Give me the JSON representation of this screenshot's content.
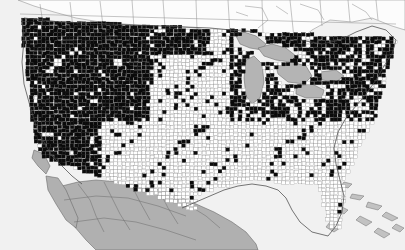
{
  "figure": {
    "name": "us-county-choropleth",
    "title": "",
    "subtitle": "",
    "caption": "",
    "has_title": false,
    "has_legend": false,
    "has_axes": false,
    "width": 405,
    "height": 250
  },
  "colors": {
    "filled_county": "#0b0b0b",
    "empty_county": "#ffffff",
    "county_border": "#8a8a8a",
    "coastline": "#4a4a4a",
    "foreign_land": "#b0b0b0",
    "lakes": "#b4b4b4",
    "canada": "#fcfcfc",
    "ocean": "#f1f1f1"
  },
  "chart_data": {
    "type": "map",
    "title": "",
    "xlabel": "",
    "ylabel": "",
    "projection": "albers-usa-like",
    "geography": "us-counties",
    "legend_position": "none",
    "classes": [
      {
        "key": "filled",
        "label": "",
        "color": "#0b0b0b"
      },
      {
        "key": "empty",
        "label": "",
        "color": "#ffffff"
      }
    ],
    "context_layers": [
      {
        "key": "canada",
        "label": "Canada",
        "color": "#fcfcfc"
      },
      {
        "key": "mexico",
        "label": "Mexico",
        "color": "#b0b0b0"
      },
      {
        "key": "great-lakes",
        "label": "Great Lakes",
        "color": "#b4b4b4"
      },
      {
        "key": "ocean",
        "label": "Ocean",
        "color": "#f1f1f1"
      },
      {
        "key": "bahamas",
        "label": "Bahamas",
        "color": "#c2c2c2"
      }
    ],
    "regions": [
      {
        "name": "Pacific Northwest",
        "fill_density": "very-high"
      },
      {
        "name": "California",
        "fill_density": "very-high"
      },
      {
        "name": "Great Basin",
        "fill_density": "very-high"
      },
      {
        "name": "Northern Rockies",
        "fill_density": "very-high"
      },
      {
        "name": "Northern Plains",
        "fill_density": "high"
      },
      {
        "name": "Upper Midwest",
        "fill_density": "high"
      },
      {
        "name": "Great Lakes States",
        "fill_density": "high"
      },
      {
        "name": "Northeast",
        "fill_density": "high"
      },
      {
        "name": "Central Plains",
        "fill_density": "low"
      },
      {
        "name": "Southern Plains",
        "fill_density": "very-low"
      },
      {
        "name": "Texas",
        "fill_density": "very-low"
      },
      {
        "name": "Southeast",
        "fill_density": "very-low"
      },
      {
        "name": "Florida",
        "fill_density": "very-low"
      }
    ]
  },
  "map_layers": {
    "counties_label": "US counties",
    "foreign_label": "Mexico",
    "canada_label": "Canada",
    "lakes_label": "Great Lakes"
  }
}
